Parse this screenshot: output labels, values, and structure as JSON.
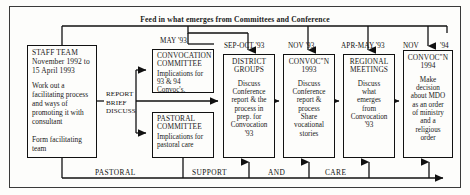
{
  "diagram": {
    "banner": "Feed in what emerges from Committees and Conference",
    "bottom_flow": {
      "words": [
        "PASTORAL",
        "SUPPORT",
        "AND",
        "CARE"
      ]
    },
    "edge_labels": {
      "report_brief_discuss": "REPORT\nBRIEF\nDISCUSS"
    },
    "date_labels": {
      "may93": "MAY '93",
      "sep_oct93": "SEP-OCT '93",
      "nov93": "NOV '93",
      "apr_may93": "APR-MAY '93",
      "nov94_left": "NOV",
      "nov94_right": "'94"
    },
    "nodes": [
      {
        "id": "staff-team",
        "title": "STAFF TEAM\nNovember 1992 to\n15 April 1993",
        "description": "Work out a\nfacilitating process\nand ways of\npromoting it with\nconsultant\n\nForm facilitating\nteam"
      },
      {
        "id": "convocation-committee",
        "title": "CONVOCATION\nCOMMITTEE",
        "description": "Implications for\n93 & 94 Convoc's."
      },
      {
        "id": "pastoral-committee",
        "title": "PASTORAL\nCOMMITTEE",
        "description": "Implications for\npastoral care"
      },
      {
        "id": "district-groups",
        "title": "DISTRICT\nGROUPS",
        "description": "Discuss\nConference\nreport & the\nprocess in\nprep. for\nConvocation\n'93"
      },
      {
        "id": "convocation-1993",
        "title": "CONVOC\"N\n1993",
        "description": "Discuss\nConference\nreport &\nprocess\nShare\nvocational\nstories"
      },
      {
        "id": "regional-meetings",
        "title": "REGIONAL\nMEETINGS",
        "description": "Discuss\nwhat\nemerges\nfrom\nConvocation\n'93"
      },
      {
        "id": "convocation-1994",
        "title": "CONVOC\"N\n1994",
        "description": "Make\ndecision\nabout MDO\nas an order\nof ministry\nand a\nreligious\norder"
      }
    ]
  }
}
